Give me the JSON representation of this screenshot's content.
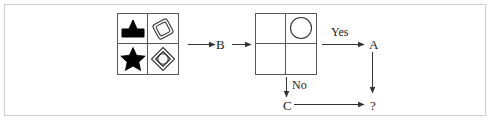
{
  "figure": {
    "background_color": "#ffffff",
    "frame_color": "#cfcfcf",
    "ink_color": "#222222",
    "stroke_color": "#585858"
  },
  "shape_grid": {
    "name": "input-shape-grid",
    "rows": 2,
    "columns": 2,
    "cells": [
      {
        "position": "top-left",
        "shape": "filled-pentagon-shape",
        "fill": "#000000",
        "stroke": "#000000"
      },
      {
        "position": "top-right",
        "shape": "rotated-rounded-square-outline-shape",
        "fill": "none",
        "stroke": "#333333"
      },
      {
        "position": "bottom-left",
        "shape": "filled-star-shape",
        "fill": "#000000",
        "stroke": "#000000"
      },
      {
        "position": "bottom-right",
        "shape": "diamond-with-inner-diamond-shape",
        "fill": "none",
        "stroke": "#333333"
      }
    ]
  },
  "decision_grid": {
    "name": "decision-shape-grid",
    "rows": 2,
    "columns": 2,
    "cells": [
      {
        "position": "top-left",
        "shape": "empty"
      },
      {
        "position": "top-right",
        "shape": "circle-outline-shape",
        "fill": "none",
        "stroke": "#333333"
      },
      {
        "position": "bottom-left",
        "shape": "empty"
      },
      {
        "position": "bottom-right",
        "shape": "empty"
      }
    ]
  },
  "nodes": {
    "b": "B",
    "a": "A",
    "c": "C",
    "question": "?"
  },
  "edges": {
    "yes": "Yes",
    "no": "No"
  }
}
